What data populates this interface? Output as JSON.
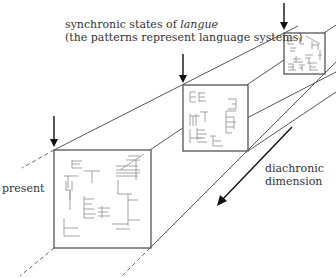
{
  "labels": {
    "title_line1_prefix": "synchronic states of ",
    "title_line1_italic": "langue",
    "title_line2": "(the patterns represent language systems)",
    "present": "present",
    "diachronic_line1": "diachronic",
    "diachronic_line2": "dimension"
  },
  "squares": [
    {
      "name": "past-state-far",
      "x": 284,
      "y": 33,
      "size": 41
    },
    {
      "name": "past-state-middle",
      "x": 183,
      "y": 85,
      "size": 65
    },
    {
      "name": "present-state",
      "x": 54,
      "y": 150,
      "size": 97
    }
  ],
  "colors": {
    "line": "#444444",
    "pattern": "#999999",
    "arrow": "#111111",
    "text": "#333333"
  }
}
